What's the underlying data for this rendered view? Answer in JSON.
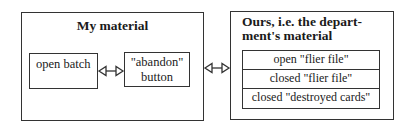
{
  "left_panel": {
    "title": "My material",
    "items": [
      {
        "label_lines": [
          "open batch"
        ]
      },
      {
        "label_lines": [
          "\"abandon\"",
          "button"
        ]
      }
    ]
  },
  "right_panel": {
    "title_lines": [
      "Ours, i.e. the depart-",
      "ment's material"
    ],
    "rows": [
      "open \"flier file\"",
      "closed \"flier file\"",
      "closed \"destroyed cards\""
    ]
  },
  "connectors": [
    {
      "from": "open batch",
      "to": "\"abandon\" button",
      "type": "bidirectional-open-arrow"
    },
    {
      "from": "My material",
      "to": "Ours, i.e. the department's material",
      "type": "bidirectional-open-arrow"
    }
  ],
  "colors": {
    "line": "#333333",
    "text": "#1a1a1a",
    "background": "#ffffff"
  }
}
